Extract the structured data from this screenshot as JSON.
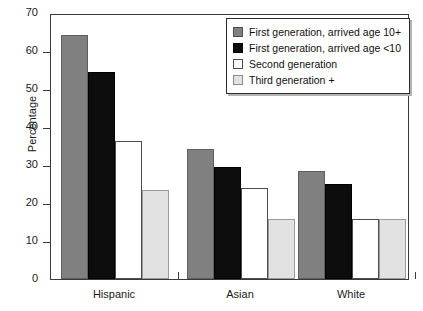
{
  "chart_data": {
    "type": "bar",
    "title": "",
    "subtitle": "",
    "xlabel": "",
    "ylabel": "Percentage",
    "categories": [
      "Hispanic",
      "Asian",
      "White"
    ],
    "series": [
      {
        "name": "First generation, arrived age 10+",
        "color": "#808080",
        "values": [
          64.2,
          34.2,
          28.4
        ]
      },
      {
        "name": "First generation, arrived age <10",
        "color": "#0d0d0d",
        "values": [
          54.6,
          29.6,
          24.9
        ]
      },
      {
        "name": "Second generation",
        "color": "#ffffff",
        "values": [
          36.4,
          24.0,
          15.8
        ]
      },
      {
        "name": "Third generation +",
        "color": "#e2e2e2",
        "values": [
          23.3,
          15.9,
          15.8
        ]
      }
    ],
    "ylim": [
      0,
      70
    ],
    "yticks": [
      0,
      10,
      20,
      30,
      40,
      50,
      60,
      70
    ],
    "ytick_labels": [
      "0",
      "10",
      "20",
      "30",
      "40",
      "50",
      "60",
      "70"
    ],
    "grid": false,
    "legend_position": "top-right",
    "legend_entries": [
      "First generation, arrived age 10+",
      "First generation, arrived age <10",
      "Second generation",
      "Third generation +"
    ]
  }
}
